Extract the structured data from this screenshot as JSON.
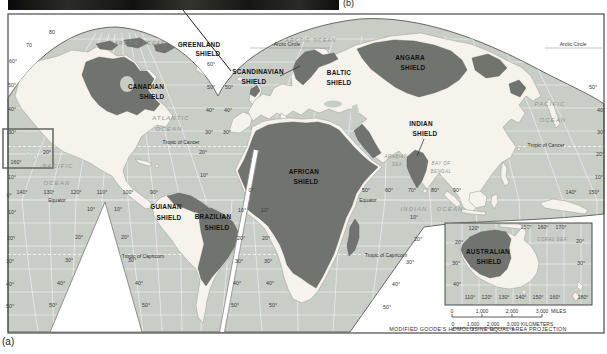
{
  "figure": {
    "panel_a": "(a)",
    "panel_b": "(b)"
  },
  "colors": {
    "ocean": "#c8cdc6",
    "land": "#f5f3ec",
    "shield": "#71746e",
    "frame": "#4a4a4a",
    "graticule": "#ffffff",
    "photo": "#1c1c1a"
  },
  "shields": {
    "greenland": [
      "GREENLAND",
      "SHIELD"
    ],
    "canadian": [
      "CANADIAN",
      "SHIELD"
    ],
    "scandinavian": [
      "SCANDINAVIAN",
      "SHIELD"
    ],
    "baltic": [
      "BALTIC",
      "SHIELD"
    ],
    "angara": [
      "ANGARA",
      "SHIELD"
    ],
    "indian": [
      "INDIAN",
      "SHIELD"
    ],
    "african": [
      "AFRICAN",
      "SHIELD"
    ],
    "guianan": [
      "GUIANAN",
      "SHIELD"
    ],
    "brazilian": [
      "BRAZILIAN",
      "SHIELD"
    ],
    "australian": [
      "AUSTRALIAN",
      "SHIELD"
    ]
  },
  "oceans": {
    "arctic_w": "ARCTIC OCEAN",
    "arctic_e": "ARCTIC OCEAN",
    "atlantic": [
      "ATLANTIC",
      "OCEAN"
    ],
    "pacific_w": [
      "PACIFIC",
      "OCEAN"
    ],
    "pacific_e": [
      "PACIFIC",
      "OCEAN"
    ],
    "indian_o": [
      "INDIAN",
      "OCEAN"
    ],
    "arabian_sea": [
      "ARABIAN",
      "SEA"
    ],
    "bay_of_bengal": [
      "BAY OF",
      "BENGAL"
    ],
    "coral_sea": "CORAL SEA"
  },
  "ref_lines": {
    "arctic_circle_w": "Arctic Circle",
    "arctic_circle_e": "Arctic Circle",
    "cancer_w": "Tropic of Cancer",
    "cancer_e": "Tropic of Cancer",
    "equator_w": "Equator",
    "equator_e": "Equator",
    "capricorn_w": "Tropic of Capricorn",
    "capricorn_e": "Tropic of Capricorn"
  },
  "scalebar": {
    "miles": [
      "0",
      "1,000",
      "2,000",
      "3,000"
    ],
    "miles_unit": "MILES",
    "km": [
      "0",
      "1,000",
      "2,000",
      "3,000"
    ],
    "km_unit": "KILOMETERS"
  },
  "caption": "MODIFIED GOODE'S HOMOLOSINE EQUAL-AREA PROJECTION",
  "tick_labels": [
    {
      "x": 52,
      "y": 34,
      "t": "80"
    },
    {
      "x": 29,
      "y": 47,
      "t": "70"
    },
    {
      "x": 13,
      "y": 63,
      "t": "60°"
    },
    {
      "x": 12,
      "y": 87,
      "t": "50°"
    },
    {
      "x": 12,
      "y": 111,
      "t": "40°"
    },
    {
      "x": 12,
      "y": 134,
      "t": "30°"
    },
    {
      "x": 16,
      "y": 164,
      "t": "160°"
    },
    {
      "x": 12,
      "y": 179,
      "t": "10°"
    },
    {
      "x": 9,
      "y": 197,
      "t": "0°"
    },
    {
      "x": 12,
      "y": 214,
      "t": "10°"
    },
    {
      "x": 11,
      "y": 240,
      "t": "20°"
    },
    {
      "x": 10,
      "y": 263,
      "t": "30°"
    },
    {
      "x": 10,
      "y": 286,
      "t": "40°"
    },
    {
      "x": 10,
      "y": 308,
      "t": "50°"
    },
    {
      "x": 47,
      "y": 154,
      "t": "20°"
    },
    {
      "x": 211,
      "y": 66,
      "t": "60°"
    },
    {
      "x": 211,
      "y": 89,
      "t": "50°"
    },
    {
      "x": 210,
      "y": 112,
      "t": "40°"
    },
    {
      "x": 209,
      "y": 134,
      "t": "30°"
    },
    {
      "x": 203,
      "y": 154,
      "t": "20°"
    },
    {
      "x": 204,
      "y": 177,
      "t": "10°"
    },
    {
      "x": 229,
      "y": 89,
      "t": "50°"
    },
    {
      "x": 228,
      "y": 112,
      "t": "40°"
    },
    {
      "x": 227,
      "y": 134,
      "t": "30°"
    },
    {
      "x": 22,
      "y": 194,
      "t": "140°"
    },
    {
      "x": 49,
      "y": 194,
      "t": "130°"
    },
    {
      "x": 76,
      "y": 194,
      "t": "120°"
    },
    {
      "x": 102,
      "y": 194,
      "t": "110°"
    },
    {
      "x": 128,
      "y": 194,
      "t": "100°"
    },
    {
      "x": 154,
      "y": 194,
      "t": "90°"
    },
    {
      "x": 91,
      "y": 211,
      "t": "10°"
    },
    {
      "x": 79,
      "y": 239,
      "t": "20°"
    },
    {
      "x": 69,
      "y": 262,
      "t": "30°"
    },
    {
      "x": 61,
      "y": 285,
      "t": "40°"
    },
    {
      "x": 53,
      "y": 307,
      "t": "50°"
    },
    {
      "x": 118,
      "y": 211,
      "t": "10°"
    },
    {
      "x": 125,
      "y": 239,
      "t": "20°"
    },
    {
      "x": 132,
      "y": 262,
      "t": "30°"
    },
    {
      "x": 139,
      "y": 285,
      "t": "40°"
    },
    {
      "x": 146,
      "y": 307,
      "t": "50°"
    },
    {
      "x": 251,
      "y": 192,
      "t": "0°"
    },
    {
      "x": 242,
      "y": 212,
      "t": "10°"
    },
    {
      "x": 241,
      "y": 240,
      "t": "20°"
    },
    {
      "x": 239,
      "y": 263,
      "t": "30°"
    },
    {
      "x": 237,
      "y": 285,
      "t": "40°"
    },
    {
      "x": 235,
      "y": 307,
      "t": "50°"
    },
    {
      "x": 265,
      "y": 212,
      "t": "10°"
    },
    {
      "x": 266,
      "y": 240,
      "t": "20°"
    },
    {
      "x": 268,
      "y": 263,
      "t": "30°"
    },
    {
      "x": 270,
      "y": 285,
      "t": "40°"
    },
    {
      "x": 273,
      "y": 307,
      "t": "50°"
    },
    {
      "x": 366,
      "y": 192,
      "t": "50°"
    },
    {
      "x": 389,
      "y": 192,
      "t": "60°"
    },
    {
      "x": 412,
      "y": 192,
      "t": "70°"
    },
    {
      "x": 435,
      "y": 192,
      "t": "80°"
    },
    {
      "x": 457,
      "y": 192,
      "t": "90°"
    },
    {
      "x": 571,
      "y": 194,
      "t": "140°"
    },
    {
      "x": 594,
      "y": 194,
      "t": "150°"
    },
    {
      "x": 414,
      "y": 219,
      "t": "10°"
    },
    {
      "x": 418,
      "y": 241,
      "t": "20°"
    },
    {
      "x": 410,
      "y": 264,
      "t": "30°"
    },
    {
      "x": 396,
      "y": 286,
      "t": "40°"
    },
    {
      "x": 387,
      "y": 309,
      "t": "50°"
    },
    {
      "x": 593,
      "y": 89,
      "t": "50°"
    },
    {
      "x": 601,
      "y": 112,
      "t": "40°"
    },
    {
      "x": 601,
      "y": 134,
      "t": "30°"
    },
    {
      "x": 600,
      "y": 156,
      "t": "20°"
    },
    {
      "x": 599,
      "y": 179,
      "t": "10°"
    },
    {
      "x": 474,
      "y": 230,
      "t": "120°"
    },
    {
      "x": 526,
      "y": 229,
      "t": "150°"
    },
    {
      "x": 543,
      "y": 229,
      "t": "160°"
    },
    {
      "x": 561,
      "y": 229,
      "t": "170°"
    },
    {
      "x": 459,
      "y": 244,
      "t": "20°"
    },
    {
      "x": 456,
      "y": 265,
      "t": "30°"
    },
    {
      "x": 457,
      "y": 286,
      "t": "40°"
    },
    {
      "x": 580,
      "y": 243,
      "t": "20°"
    },
    {
      "x": 581,
      "y": 265,
      "t": "30°"
    },
    {
      "x": 470,
      "y": 299,
      "t": "110°"
    },
    {
      "x": 487,
      "y": 299,
      "t": "120°"
    },
    {
      "x": 504,
      "y": 299,
      "t": "130°"
    },
    {
      "x": 521,
      "y": 299,
      "t": "140°"
    },
    {
      "x": 538,
      "y": 299,
      "t": "150°"
    },
    {
      "x": 555,
      "y": 299,
      "t": "160°"
    },
    {
      "x": 583,
      "y": 299,
      "t": "180°"
    }
  ]
}
